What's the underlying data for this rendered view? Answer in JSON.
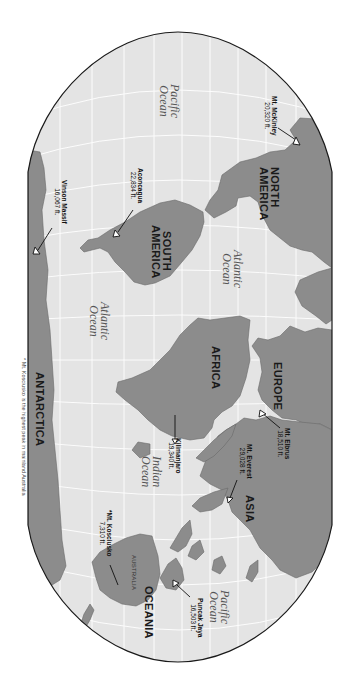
{
  "map": {
    "title": "World Map - Highest Peaks by Continent",
    "orientation": "rotated 90 degrees clockwise",
    "colors": {
      "land": "#8c8c8c",
      "ocean": "#e4e4e4",
      "graticule": "#ffffff",
      "outline": "#1a1a1a",
      "background": "#ffffff"
    },
    "continents": [
      {
        "id": "north-america",
        "label": "NORTH\nAMERICA",
        "line1": "NORTH",
        "line2": "AMERICA"
      },
      {
        "id": "south-america",
        "label": "SOUTH AMERICA",
        "line1": "SOUTH",
        "line2": "AMERICA"
      },
      {
        "id": "africa",
        "label": "AFRICA"
      },
      {
        "id": "europe",
        "label": "EUROPE"
      },
      {
        "id": "asia",
        "label": "ASIA"
      },
      {
        "id": "oceania",
        "label": "OCEANIA"
      },
      {
        "id": "australia",
        "label": "AUSTRALIA"
      },
      {
        "id": "antarctica",
        "label": "ANTARCTICA"
      }
    ],
    "oceans": [
      {
        "id": "pacific-west",
        "line1": "Pacific",
        "line2": "Ocean"
      },
      {
        "id": "atlantic-north",
        "line1": "Atlantic",
        "line2": "Ocean"
      },
      {
        "id": "atlantic-south",
        "line1": "Atlantic",
        "line2": "Ocean"
      },
      {
        "id": "indian",
        "line1": "Indian",
        "line2": "Ocean"
      },
      {
        "id": "pacific-east",
        "line1": "Pacific",
        "line2": "Ocean"
      }
    ],
    "peaks": [
      {
        "id": "mckinley",
        "name": "Mt. McKinley",
        "elevation": "20,320 ft."
      },
      {
        "id": "aconcagua",
        "name": "Aconcagua",
        "elevation": "22,834 ft."
      },
      {
        "id": "vinson",
        "name": "Vinson Massif",
        "elevation": "16,067 ft."
      },
      {
        "id": "elbrus",
        "name": "Mt. Elbrus",
        "elevation": "18,510 ft."
      },
      {
        "id": "everest",
        "name": "Mt. Everest",
        "elevation": "29,028 ft."
      },
      {
        "id": "kilimanjaro",
        "name": "Kilimanjaro",
        "elevation": "19,340 ft."
      },
      {
        "id": "kosciusko",
        "name": "*Mt. Kosciusko",
        "elevation": "7,310 ft."
      },
      {
        "id": "puncak-jaya",
        "name": "Puncak Jaya",
        "elevation": "16,503 ft."
      }
    ],
    "footnote": "* Mt. Kosciusko is the highest peak in mainland Australia"
  }
}
